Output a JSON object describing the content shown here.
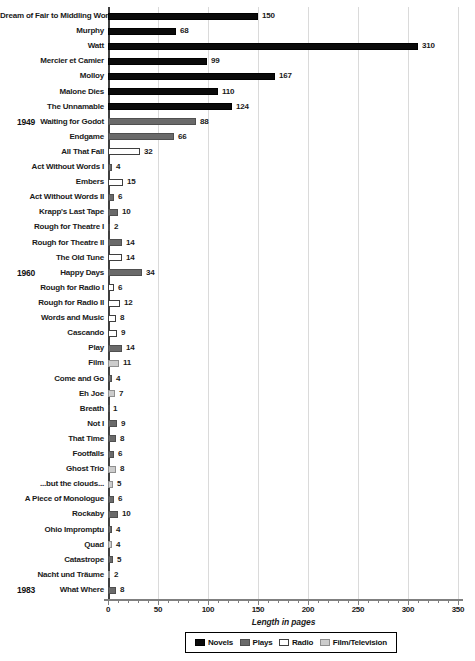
{
  "chart_data": {
    "type": "bar",
    "orientation": "horizontal",
    "xlabel": "Length in pages",
    "xlim": [
      0,
      350
    ],
    "x_major_ticks": [
      0,
      50,
      100,
      150,
      200,
      250,
      300,
      350
    ],
    "x_minor_tick_step": 10,
    "grid": "vertical-major",
    "legend_position": "bottom-center",
    "categories_legend": [
      {
        "key": "novels",
        "label": "Novels",
        "fill": "#0a0a0a",
        "border": "#000000"
      },
      {
        "key": "plays",
        "label": "Plays",
        "fill": "#6a6a6a",
        "border": "#4f4f4f"
      },
      {
        "key": "radio",
        "label": "Radio",
        "fill": "#ffffff",
        "border": "#3f3f3f"
      },
      {
        "key": "film",
        "label": "Film/Television",
        "fill": "#cccccc",
        "border": "#8f8f8f"
      }
    ],
    "year_annotations": [
      {
        "year": "1949",
        "work": "Waiting for Godot"
      },
      {
        "year": "1960",
        "work": "Happy Days"
      },
      {
        "year": "1983",
        "work": "What Where"
      }
    ],
    "bars": [
      {
        "label": "Dream of Fair to Middling Women",
        "value": 150,
        "category": "novels"
      },
      {
        "label": "Murphy",
        "value": 68,
        "category": "novels"
      },
      {
        "label": "Watt",
        "value": 310,
        "category": "novels"
      },
      {
        "label": "Mercier et Camier",
        "value": 99,
        "category": "novels"
      },
      {
        "label": "Molloy",
        "value": 167,
        "category": "novels"
      },
      {
        "label": "Malone Dies",
        "value": 110,
        "category": "novels"
      },
      {
        "label": "The Unnamable",
        "value": 124,
        "category": "novels"
      },
      {
        "label": "Waiting for Godot",
        "value": 88,
        "category": "plays",
        "year": "1949"
      },
      {
        "label": "Endgame",
        "value": 66,
        "category": "plays"
      },
      {
        "label": "All That Fall",
        "value": 32,
        "category": "radio"
      },
      {
        "label": "Act Without Words I",
        "value": 4,
        "category": "plays"
      },
      {
        "label": "Embers",
        "value": 15,
        "category": "radio"
      },
      {
        "label": "Act Without Words II",
        "value": 6,
        "category": "plays"
      },
      {
        "label": "Krapp's Last Tape",
        "value": 10,
        "category": "plays"
      },
      {
        "label": "Rough for Theatre I",
        "value": 2,
        "category": "plays"
      },
      {
        "label": "Rough for Theatre II",
        "value": 14,
        "category": "plays"
      },
      {
        "label": "The Old Tune",
        "value": 14,
        "category": "radio"
      },
      {
        "label": "Happy Days",
        "value": 34,
        "category": "plays",
        "year": "1960"
      },
      {
        "label": "Rough for Radio I",
        "value": 6,
        "category": "radio"
      },
      {
        "label": "Rough for Radio II",
        "value": 12,
        "category": "radio"
      },
      {
        "label": "Words and Music",
        "value": 8,
        "category": "radio"
      },
      {
        "label": "Cascando",
        "value": 9,
        "category": "radio"
      },
      {
        "label": "Play",
        "value": 14,
        "category": "plays"
      },
      {
        "label": "Film",
        "value": 11,
        "category": "film"
      },
      {
        "label": "Come and Go",
        "value": 4,
        "category": "plays"
      },
      {
        "label": "Eh Joe",
        "value": 7,
        "category": "film"
      },
      {
        "label": "Breath",
        "value": 1,
        "category": "plays"
      },
      {
        "label": "Not I",
        "value": 9,
        "category": "plays"
      },
      {
        "label": "That Time",
        "value": 8,
        "category": "plays"
      },
      {
        "label": "Footfalls",
        "value": 6,
        "category": "plays"
      },
      {
        "label": "Ghost Trio",
        "value": 8,
        "category": "film"
      },
      {
        "label": "...but the clouds...",
        "value": 5,
        "category": "film"
      },
      {
        "label": "A Piece of Monologue",
        "value": 6,
        "category": "plays"
      },
      {
        "label": "Rockaby",
        "value": 10,
        "category": "plays"
      },
      {
        "label": "Ohio Impromptu",
        "value": 4,
        "category": "plays"
      },
      {
        "label": "Quad",
        "value": 4,
        "category": "film"
      },
      {
        "label": "Catastrope",
        "value": 5,
        "category": "plays"
      },
      {
        "label": "Nacht und Träume",
        "value": 2,
        "category": "film"
      },
      {
        "label": "What Where",
        "value": 8,
        "category": "plays",
        "year": "1983"
      }
    ]
  }
}
